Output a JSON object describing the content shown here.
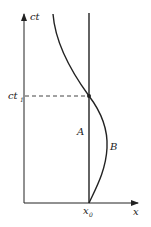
{
  "diagram": {
    "type": "spacetime-worldlines",
    "axes": {
      "vertical_label": "ct",
      "horizontal_label": "x"
    },
    "markers": {
      "time_mark": "ct",
      "time_mark_sub": "1",
      "position_mark": "x",
      "position_mark_sub": "0"
    },
    "worldlines": [
      {
        "name": "A",
        "label": "A",
        "kind": "straight vertical"
      },
      {
        "name": "B",
        "label": "B",
        "kind": "curved"
      }
    ],
    "colors": {
      "line": "#222222",
      "dashed": "#444444"
    }
  }
}
